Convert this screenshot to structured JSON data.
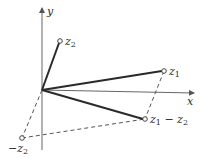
{
  "diagram": {
    "axes": {
      "x_label": "x",
      "y_label": "y"
    },
    "points": [
      {
        "id": "z1",
        "label": "z",
        "sub": "1",
        "x": 164,
        "y": 71
      },
      {
        "id": "z2",
        "label": "z",
        "sub": "2",
        "x": 60,
        "y": 41
      },
      {
        "id": "neg_z2",
        "label": "−z",
        "sub": "2",
        "x": 22,
        "y": 138
      },
      {
        "id": "z1_minus_z2",
        "label": "z",
        "sub": "1",
        "label_tail": " − z",
        "sub2": "2",
        "x": 145,
        "y": 119
      }
    ],
    "origin": {
      "x": 42,
      "y": 90
    },
    "colors": {
      "solid": "#2a2a2a",
      "axis": "#555555",
      "dashed": "#555555"
    }
  }
}
